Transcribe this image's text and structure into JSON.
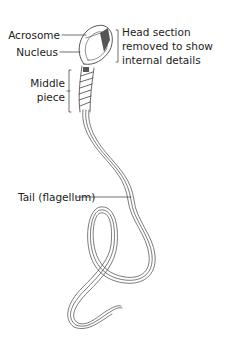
{
  "diagram": {
    "labels": {
      "acrosome": "Acrosome",
      "nucleus": "Nucleus",
      "head_note_line1": "Head section",
      "head_note_line2": "removed to show",
      "head_note_line3": "internal details",
      "middle_piece_line1": "Middle",
      "middle_piece_line2": "piece",
      "tail": "Tail (flagellum)"
    },
    "colors": {
      "line": "#333333",
      "fill_dark": "#555555",
      "background": "#ffffff"
    }
  }
}
